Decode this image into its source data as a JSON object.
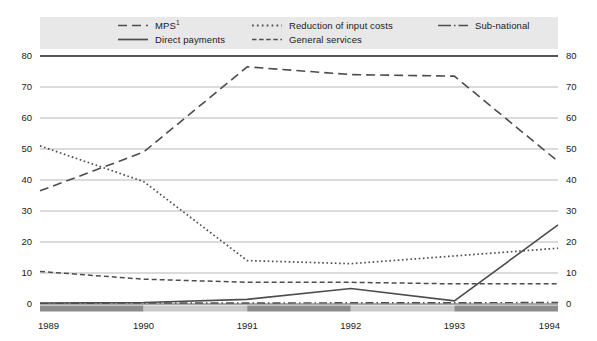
{
  "chart_data": {
    "type": "line",
    "title": "",
    "xlabel": "",
    "ylabel": "",
    "x": [
      "1989",
      "1990",
      "1991",
      "1992",
      "1993",
      "1994"
    ],
    "categories": [
      "1989",
      "1990",
      "1991",
      "1992",
      "1993",
      "1994"
    ],
    "ylim": [
      0,
      80
    ],
    "yticks": [
      0,
      10,
      20,
      30,
      40,
      50,
      60,
      70,
      80
    ],
    "ytick_labels_left": [
      "0",
      "10",
      "20",
      "30",
      "40",
      "50",
      "60",
      "70",
      "80"
    ],
    "ytick_labels_right": [
      "0",
      "10",
      "20",
      "30",
      "40",
      "50",
      "60",
      "70",
      "80"
    ],
    "grid": true,
    "legend_position": "top",
    "series": [
      {
        "name": "MPS",
        "label": "MPS",
        "superscript": "1",
        "style": "long-dash",
        "dasharray": "9,5",
        "width": 1.6,
        "color": "#4d4d4d",
        "values": [
          36.5,
          49,
          76.5,
          74,
          73.5,
          46
        ]
      },
      {
        "name": "Direct payments",
        "label": "Direct payments",
        "superscript": "",
        "style": "solid",
        "dasharray": "",
        "width": 1.6,
        "color": "#4d4d4d",
        "values": [
          0.3,
          0.5,
          1.5,
          5.0,
          1.0,
          25.5
        ]
      },
      {
        "name": "Reduction of input costs",
        "label": "Reduction of input costs",
        "superscript": "",
        "style": "dotted",
        "dasharray": "1.6,2.6",
        "width": 1.7,
        "color": "#4d4d4d",
        "values": [
          51,
          39.5,
          14,
          13,
          15.5,
          18
        ]
      },
      {
        "name": "General services",
        "label": "General services",
        "superscript": "",
        "style": "dashed",
        "dasharray": "5,3",
        "width": 1.5,
        "color": "#4d4d4d",
        "values": [
          10.5,
          8,
          7,
          7,
          6.5,
          6.5
        ]
      },
      {
        "name": "Sub-national",
        "label": "Sub-national",
        "superscript": "",
        "style": "dash-dot",
        "dasharray": "8,3,1.5,3",
        "width": 1.4,
        "color": "#4d4d4d",
        "values": [
          0.2,
          0.3,
          0.3,
          0.4,
          0.4,
          0.5
        ]
      }
    ]
  },
  "legend": {
    "items": [
      {
        "label": "MPS",
        "superscript": "1"
      },
      {
        "label": "Direct payments",
        "superscript": ""
      },
      {
        "label": "Reduction of input costs",
        "superscript": ""
      },
      {
        "label": "General services",
        "superscript": ""
      },
      {
        "label": "Sub-national",
        "superscript": ""
      }
    ]
  },
  "colors": {
    "legend_background": "#e8e8e8",
    "grid": "#9a9a9a",
    "axis": "#555555",
    "axis_band": "#8c8c8c",
    "axis_band_alt": "#c9c9c9",
    "line": "#4d4d4d",
    "text": "#1a1a1a",
    "page_background": "#ffffff"
  }
}
